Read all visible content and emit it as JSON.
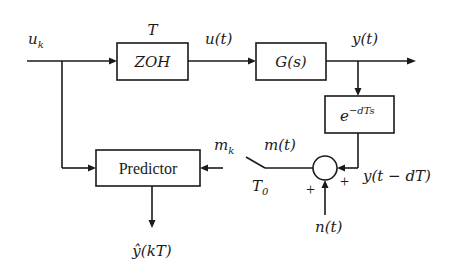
{
  "diagram": {
    "type": "block-diagram",
    "blocks": {
      "zoh": {
        "label": "ZOH",
        "sample_label": "T"
      },
      "plant": {
        "label": "G(s)"
      },
      "delay": {
        "base": "e",
        "exponent": "−dTs"
      },
      "predictor": {
        "label": "Predictor"
      }
    },
    "signals": {
      "input": {
        "base": "u",
        "sub": "k"
      },
      "zoh_output": "u(t)",
      "plant_output": "y(t)",
      "delayed_output": "y(t − dT)",
      "noise": "n(t)",
      "measured": "m(t)",
      "sampled_measured": {
        "base": "m",
        "sub": "k"
      },
      "switch_period": {
        "base": "T",
        "sub": "0"
      },
      "estimate": "ŷ(kT)"
    },
    "summer": {
      "sign_noise": "+",
      "sign_delayed": "+"
    }
  }
}
